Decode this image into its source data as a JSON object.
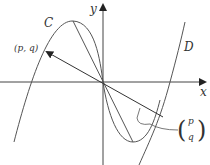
{
  "diagram": {
    "axes": {
      "x_label": "x",
      "y_label": "y"
    },
    "curves": [
      {
        "name": "C",
        "label": "C",
        "description": "cubic-like curve through origin"
      },
      {
        "name": "D",
        "label": "D",
        "description": "image of C under vector translation"
      }
    ],
    "point_label": "(p, q)",
    "vector_label": {
      "top": "p",
      "bottom": "q"
    },
    "colors": {
      "stroke": "#444444",
      "text": "#333333",
      "background": "#ffffff"
    }
  }
}
